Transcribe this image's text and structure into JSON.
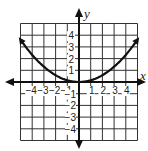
{
  "chart_data": {
    "type": "line",
    "title": "",
    "xlabel": "x",
    "ylabel": "y",
    "xlim": [
      -5,
      5
    ],
    "ylim": [
      -5,
      5
    ],
    "grid": true,
    "x_ticks": [
      "-4",
      "-3",
      "-2",
      "-1",
      "1",
      "2",
      "3",
      "4"
    ],
    "y_ticks": [
      "4",
      "3",
      "2",
      "1",
      "-1",
      "-2",
      "-3",
      "-4"
    ],
    "series": [
      {
        "name": "curve",
        "description": "upward-opening parabola with vertex at origin, arrows at both ends",
        "x": [
          -5,
          -4,
          -3,
          -2,
          -1,
          0,
          1,
          2,
          3,
          4,
          5
        ],
        "y": [
          3.6,
          2.3,
          1.3,
          0.6,
          0.15,
          0,
          0.15,
          0.6,
          1.3,
          2.3,
          3.6
        ]
      }
    ]
  },
  "labels": {
    "x_axis": "x",
    "y_axis": "y",
    "x_ticks": [
      "−4",
      "−3",
      "−2",
      "−1",
      "1",
      "2",
      "3",
      "4"
    ],
    "y_ticks_pos": [
      "4",
      "3",
      "2",
      "1"
    ],
    "y_ticks_neg": [
      "−1",
      "−2",
      "−3",
      "−4"
    ]
  }
}
